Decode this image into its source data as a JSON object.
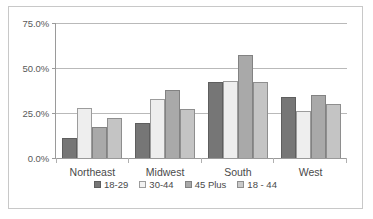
{
  "chart_data": {
    "type": "bar",
    "title": "",
    "subtitle": "",
    "xlabel": "",
    "ylabel": "",
    "categories": [
      "Northeast",
      "Midwest",
      "South",
      "West"
    ],
    "series": [
      {
        "name": "18-29",
        "color": "#767676",
        "values": [
          11.0,
          19.5,
          42.0,
          34.0
        ]
      },
      {
        "name": "30-44",
        "color": "#eeeeee",
        "values": [
          28.0,
          33.0,
          43.0,
          26.0
        ]
      },
      {
        "name": "45 Plus",
        "color": "#a9a9a9",
        "values": [
          17.5,
          38.0,
          57.5,
          35.0
        ]
      },
      {
        "name": "18 - 44",
        "color": "#c4c4c4",
        "values": [
          22.0,
          27.0,
          42.5,
          30.0
        ]
      }
    ],
    "ylim": [
      0,
      75
    ],
    "yticks": [
      0,
      25,
      50,
      75
    ],
    "ytick_labels": [
      "0.0%",
      "25.0%",
      "50.0%",
      "75.0%"
    ],
    "grid": true,
    "grid_axis": "y",
    "legend_position": "bottom",
    "value_format": "percent"
  },
  "axis": {
    "y": {
      "ticks": [
        {
          "value": 75,
          "label": "75.0%"
        },
        {
          "value": 50,
          "label": "50.0%"
        },
        {
          "value": 25,
          "label": "25.0%"
        },
        {
          "value": 0,
          "label": "0.0%"
        }
      ]
    },
    "x": {
      "ticks": [
        {
          "label": "Northeast"
        },
        {
          "label": "Midwest"
        },
        {
          "label": "South"
        },
        {
          "label": "West"
        }
      ]
    }
  },
  "legend": {
    "items": [
      {
        "label": "18-29"
      },
      {
        "label": "30-44"
      },
      {
        "label": "45 Plus"
      },
      {
        "label": "18 - 44"
      }
    ]
  }
}
